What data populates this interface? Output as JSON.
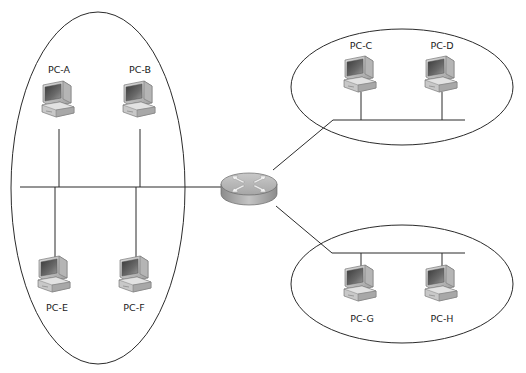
{
  "diagram": {
    "type": "network-topology",
    "router": {
      "label": "",
      "x": 249,
      "y": 186,
      "icon": "router-icon"
    },
    "segments": [
      {
        "id": "left",
        "shape": "ellipse",
        "ellipse": {
          "cx": 98,
          "cy": 188,
          "rx": 87,
          "ry": 176
        },
        "bus": {
          "x1": 20,
          "y1": 187,
          "x2": 226,
          "y2": 187
        },
        "hosts": [
          {
            "label": "PC-A",
            "x": 59,
            "y": 97,
            "position": "above"
          },
          {
            "label": "PC-B",
            "x": 140,
            "y": 97,
            "position": "above"
          },
          {
            "label": "PC-E",
            "x": 55,
            "y": 287,
            "position": "below"
          },
          {
            "label": "PC-F",
            "x": 136,
            "y": 287,
            "position": "below"
          }
        ]
      },
      {
        "id": "top-right",
        "shape": "ellipse",
        "ellipse": {
          "cx": 402,
          "cy": 87,
          "rx": 111,
          "ry": 58
        },
        "bus": {
          "x1": 333,
          "y1": 120,
          "x2": 465,
          "y2": 120
        },
        "hosts": [
          {
            "label": "PC-C",
            "x": 361,
            "y": 60,
            "position": "above"
          },
          {
            "label": "PC-D",
            "x": 442,
            "y": 60,
            "position": "above"
          }
        ]
      },
      {
        "id": "bottom-right",
        "shape": "ellipse",
        "ellipse": {
          "cx": 402,
          "cy": 284,
          "rx": 111,
          "ry": 59
        },
        "bus": {
          "x1": 332,
          "y1": 253,
          "x2": 465,
          "y2": 253
        },
        "hosts": [
          {
            "label": "PC-G",
            "x": 361,
            "y": 292,
            "position": "below"
          },
          {
            "label": "PC-H",
            "x": 442,
            "y": 292,
            "position": "below"
          }
        ]
      }
    ],
    "links": [
      {
        "from": "router",
        "to": "top-right",
        "x1": 273,
        "y1": 170,
        "x2": 333,
        "y2": 120
      },
      {
        "from": "router",
        "to": "bottom-right",
        "x1": 276,
        "y1": 206,
        "x2": 332,
        "y2": 253
      }
    ],
    "colors": {
      "line": "#2b2b2b",
      "router_top": "#b8b8b8",
      "router_side": "#9a9a9a",
      "arrow": "#f2f2f2"
    }
  },
  "hosts_labels": {
    "pc_a": "PC-A",
    "pc_b": "PC-B",
    "pc_c": "PC-C",
    "pc_d": "PC-D",
    "pc_e": "PC-E",
    "pc_f": "PC-F",
    "pc_g": "PC-G",
    "pc_h": "PC-H"
  }
}
